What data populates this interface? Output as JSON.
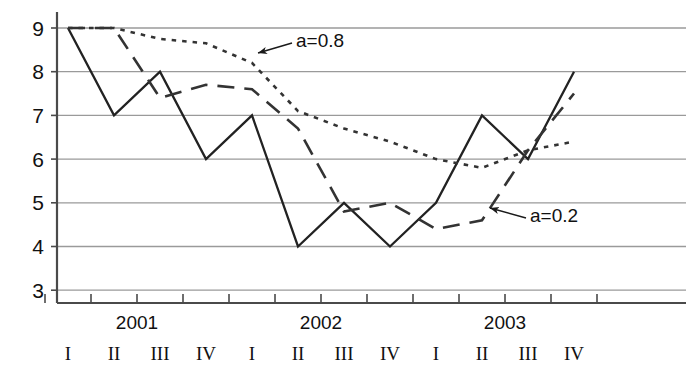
{
  "chart_data": {
    "type": "line",
    "title": "",
    "xlabel": "",
    "ylabel": "",
    "ylim": [
      2.4,
      9.55
    ],
    "grid": true,
    "grid_values": [
      3,
      4,
      5,
      6,
      7,
      8,
      9
    ],
    "y_tick_labels": [
      "9",
      "8",
      "7",
      "6",
      "5",
      "4",
      "3"
    ],
    "legend_position": "inline-annotations",
    "x": [
      1,
      2,
      3,
      4,
      5,
      6,
      7,
      8,
      9,
      10,
      11,
      12
    ],
    "categories": [
      "2001 I",
      "2001 II",
      "2001 III",
      "2001 IV",
      "2002 I",
      "2002 II",
      "2002 III",
      "2002 IV",
      "2003 I",
      "2003 II",
      "2003 III",
      "2003 IV"
    ],
    "quarter_labels": [
      "I",
      "II",
      "III",
      "IV",
      "I",
      "II",
      "III",
      "IV",
      "I",
      "II",
      "III",
      "IV"
    ],
    "year_groups": [
      {
        "label": "2001",
        "start_index": 0,
        "end_index": 3
      },
      {
        "label": "2002",
        "start_index": 4,
        "end_index": 7
      },
      {
        "label": "2003",
        "start_index": 8,
        "end_index": 11
      }
    ],
    "series": [
      {
        "name": "actual",
        "style": "solid",
        "color": "#222222",
        "values": [
          9,
          7,
          8,
          6,
          7,
          4,
          5,
          4,
          5,
          7,
          6,
          8
        ]
      },
      {
        "name": "a=0.2",
        "style": "dashed",
        "color": "#333333",
        "values": [
          9,
          9,
          7.4,
          7.7,
          7.6,
          6.7,
          4.8,
          5.0,
          4.4,
          4.6,
          6.2,
          7.5
        ]
      },
      {
        "name": "a=0.8",
        "style": "dotted",
        "color": "#333333",
        "values": [
          9,
          9,
          8.75,
          8.65,
          8.2,
          7.1,
          6.7,
          6.4,
          6.0,
          5.8,
          6.2,
          6.4
        ]
      }
    ],
    "annotations": [
      {
        "id": "annot-a08",
        "text": "a=0.8",
        "text_x": 296,
        "text_y": 47,
        "arrow_from_x": 292,
        "arrow_from_y": 43,
        "arrow_to_x": 258,
        "arrow_to_y": 53
      },
      {
        "id": "annot-a02",
        "text": "a=0.2",
        "text_x": 530,
        "text_y": 222,
        "arrow_from_x": 526,
        "arrow_from_y": 218,
        "arrow_to_x": 490,
        "arrow_to_y": 208
      }
    ],
    "axis_colors": {
      "grid": "#9a9a9a",
      "axis": "#4a4a4a",
      "text": "#111111"
    }
  },
  "axes": {
    "y_axis_x": 57,
    "x_axis_y": 303,
    "plot_right": 686,
    "plot_top": 12,
    "x_first_tick": 68,
    "x_tick_spacing": 46,
    "value_9_y": 28,
    "value_step_y": 43.7
  }
}
